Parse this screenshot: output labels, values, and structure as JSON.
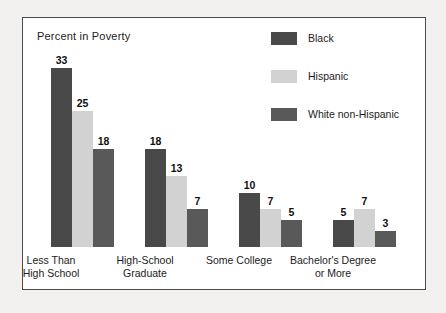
{
  "chart": {
    "title": "Percent in Poverty"
  },
  "legend": {
    "items": [
      {
        "label": "Black",
        "color": "#494949"
      },
      {
        "label": "Hispanic",
        "color": "#d2d2d2"
      },
      {
        "label": "White non-Hispanic",
        "color": "#595959"
      }
    ]
  },
  "chart_data": {
    "type": "bar",
    "title": "Percent in Poverty",
    "xlabel": "",
    "ylabel": "Percent in Poverty",
    "ylim": [
      0,
      35
    ],
    "grid": false,
    "legend_position": "top-right",
    "categories": [
      "Less Than\nHigh School",
      "High-School\nGraduate",
      "Some College",
      "Bachelor's Degree\nor More"
    ],
    "series": [
      {
        "name": "Black",
        "color": "#494949",
        "values": [
          33,
          18,
          10,
          5
        ]
      },
      {
        "name": "Hispanic",
        "color": "#d2d2d2",
        "values": [
          25,
          13,
          7,
          7
        ]
      },
      {
        "name": "White non-Hispanic",
        "color": "#595959",
        "values": [
          18,
          7,
          5,
          3
        ]
      }
    ]
  }
}
